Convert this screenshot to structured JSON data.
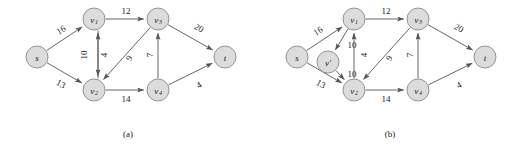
{
  "figure": {
    "width": 520,
    "height": 148,
    "background": "#ffffff",
    "node_fill": "#dcdcdc",
    "node_stroke": "#8a8a8a",
    "edge_color": "#555555",
    "text_color": "#1a1a1a"
  },
  "panels": [
    {
      "id": "a",
      "caption": "(a)",
      "caption_x": 128,
      "caption_y": 134,
      "nodes": [
        {
          "id": "s",
          "label": "s",
          "sub": "",
          "x": 37,
          "y": 57,
          "r": 11
        },
        {
          "id": "v1",
          "label": "v",
          "sub": "1",
          "x": 94,
          "y": 19,
          "r": 11
        },
        {
          "id": "v2",
          "label": "v",
          "sub": "2",
          "x": 94,
          "y": 90,
          "r": 11
        },
        {
          "id": "v3",
          "label": "v",
          "sub": "3",
          "x": 158,
          "y": 19,
          "r": 11
        },
        {
          "id": "v4",
          "label": "v",
          "sub": "4",
          "x": 158,
          "y": 90,
          "r": 11
        },
        {
          "id": "t",
          "label": "t",
          "sub": "",
          "x": 225,
          "y": 57,
          "r": 11
        }
      ],
      "edges": [
        {
          "from": "s",
          "to": "v1",
          "capacity": "16",
          "label_x": 61,
          "label_y": 30,
          "rotate": -33,
          "offset": 0
        },
        {
          "from": "s",
          "to": "v2",
          "capacity": "13",
          "label_x": 61,
          "label_y": 84,
          "rotate": 30,
          "offset": 0
        },
        {
          "from": "v1",
          "to": "v3",
          "capacity": "12",
          "label_x": 126,
          "label_y": 11,
          "rotate": 0,
          "offset": 0
        },
        {
          "from": "v1",
          "to": "v2",
          "capacity": "10",
          "label_x": 84,
          "label_y": 55,
          "rotate": -90,
          "offset": -4
        },
        {
          "from": "v2",
          "to": "v1",
          "capacity": "4",
          "label_x": 104,
          "label_y": 55,
          "rotate": -90,
          "offset": 4
        },
        {
          "from": "v3",
          "to": "v2",
          "capacity": "9",
          "label_x": 129,
          "label_y": 58,
          "rotate": -60,
          "offset": 0
        },
        {
          "from": "v2",
          "to": "v4",
          "capacity": "14",
          "label_x": 126,
          "label_y": 99,
          "rotate": 0,
          "offset": 0
        },
        {
          "from": "v4",
          "to": "v3",
          "capacity": "7",
          "label_x": 150,
          "label_y": 55,
          "rotate": -90,
          "offset": 0
        },
        {
          "from": "v3",
          "to": "t",
          "capacity": "20",
          "label_x": 199,
          "label_y": 28,
          "rotate": 32,
          "offset": 0
        },
        {
          "from": "v4",
          "to": "t",
          "capacity": "4",
          "label_x": 199,
          "label_y": 85,
          "rotate": -30,
          "offset": 0
        }
      ]
    },
    {
      "id": "b",
      "caption": "(b)",
      "caption_x": 390,
      "caption_y": 134,
      "nodes": [
        {
          "id": "s",
          "label": "s",
          "sub": "",
          "x": 297,
          "y": 57,
          "r": 11
        },
        {
          "id": "vp",
          "label": "v'",
          "sub": "",
          "x": 328,
          "y": 62,
          "r": 11
        },
        {
          "id": "v1",
          "label": "v",
          "sub": "1",
          "x": 354,
          "y": 19,
          "r": 11
        },
        {
          "id": "v2",
          "label": "v",
          "sub": "2",
          "x": 354,
          "y": 90,
          "r": 11
        },
        {
          "id": "v3",
          "label": "v",
          "sub": "3",
          "x": 418,
          "y": 19,
          "r": 11
        },
        {
          "id": "v4",
          "label": "v",
          "sub": "4",
          "x": 418,
          "y": 90,
          "r": 11
        },
        {
          "id": "t",
          "label": "t",
          "sub": "",
          "x": 485,
          "y": 57,
          "r": 11
        }
      ],
      "edges": [
        {
          "from": "s",
          "to": "v1",
          "capacity": "16",
          "label_x": 318,
          "label_y": 31,
          "rotate": -33,
          "offset": 0
        },
        {
          "from": "s",
          "to": "v2",
          "capacity": "13",
          "label_x": 321,
          "label_y": 84,
          "rotate": 30,
          "offset": 0
        },
        {
          "from": "v1",
          "to": "vp",
          "capacity": "10",
          "label_x": 352,
          "label_y": 45,
          "rotate": 0,
          "offset": 0
        },
        {
          "from": "vp",
          "to": "v2",
          "capacity": "10",
          "label_x": 352,
          "label_y": 74,
          "rotate": 0,
          "offset": 0
        },
        {
          "from": "v1",
          "to": "v3",
          "capacity": "12",
          "label_x": 386,
          "label_y": 11,
          "rotate": 0,
          "offset": 0
        },
        {
          "from": "v2",
          "to": "v1",
          "capacity": "4",
          "label_x": 364,
          "label_y": 55,
          "rotate": -90,
          "offset": 0
        },
        {
          "from": "v3",
          "to": "v2",
          "capacity": "9",
          "label_x": 389,
          "label_y": 58,
          "rotate": -60,
          "offset": 0
        },
        {
          "from": "v2",
          "to": "v4",
          "capacity": "14",
          "label_x": 386,
          "label_y": 99,
          "rotate": 0,
          "offset": 0
        },
        {
          "from": "v4",
          "to": "v3",
          "capacity": "7",
          "label_x": 410,
          "label_y": 55,
          "rotate": -90,
          "offset": 0
        },
        {
          "from": "v3",
          "to": "t",
          "capacity": "20",
          "label_x": 459,
          "label_y": 28,
          "rotate": 32,
          "offset": 0
        },
        {
          "from": "v4",
          "to": "t",
          "capacity": "4",
          "label_x": 459,
          "label_y": 85,
          "rotate": -30,
          "offset": 0
        }
      ]
    }
  ]
}
